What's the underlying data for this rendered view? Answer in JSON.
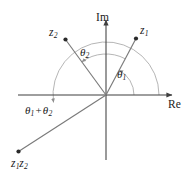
{
  "figure": {
    "background_color": "#ffffff",
    "axis_color": "#3f3f3f",
    "ray_color": "#7a7a7a",
    "arc_color": "#a8a8a8",
    "text_color": "#1a1a1a",
    "width": 196,
    "height": 173
  },
  "axes": {
    "imaginary": {
      "label": "Im",
      "x": 106,
      "y_top": 15,
      "y_bottom": 160,
      "arrow": "up"
    },
    "real": {
      "label": "Re",
      "y": 95,
      "x_left": 18,
      "x_right": 178,
      "arrow": "right"
    }
  },
  "origin": {
    "x": 106,
    "y": 95
  },
  "vectors": [
    {
      "name": "z1",
      "label_main": "z",
      "label_sub": "1",
      "tip": {
        "x": 136,
        "y": 38
      },
      "angle_deg": 62,
      "label_pos": {
        "x": 140,
        "y": 27
      }
    },
    {
      "name": "z2",
      "label_main": "z",
      "label_sub": "2",
      "tip": {
        "x": 65,
        "y": 39
      },
      "angle_deg": 126,
      "label_pos": {
        "x": 50,
        "y": 29
      }
    },
    {
      "name": "z1z2",
      "label_main_a": "z",
      "label_sub_a": "1",
      "label_main_b": "z",
      "label_sub_b": "2",
      "tip": {
        "x": 18,
        "y": 152
      },
      "angle_deg": 188,
      "label_pos": {
        "x": 12,
        "y": 160
      }
    }
  ],
  "angles": [
    {
      "name": "theta1",
      "symbol": "θ",
      "sub": "1",
      "radius": 28,
      "from_deg": 0,
      "to_deg": 62,
      "label_pos": {
        "x": 118,
        "y": 74
      }
    },
    {
      "name": "theta2",
      "symbol": "θ",
      "sub": "2",
      "radius": 41,
      "from_deg": 62,
      "to_deg": 126,
      "label_pos": {
        "x": 81,
        "y": 52
      }
    },
    {
      "name": "theta1-plus-theta2",
      "symbol_a": "θ",
      "sub_a": "1",
      "operator": "+",
      "symbol_b": "θ",
      "sub_b": "2",
      "radius": 53,
      "from_deg": 0,
      "to_deg": 188,
      "label_pos": {
        "x": 26,
        "y": 110
      }
    }
  ]
}
